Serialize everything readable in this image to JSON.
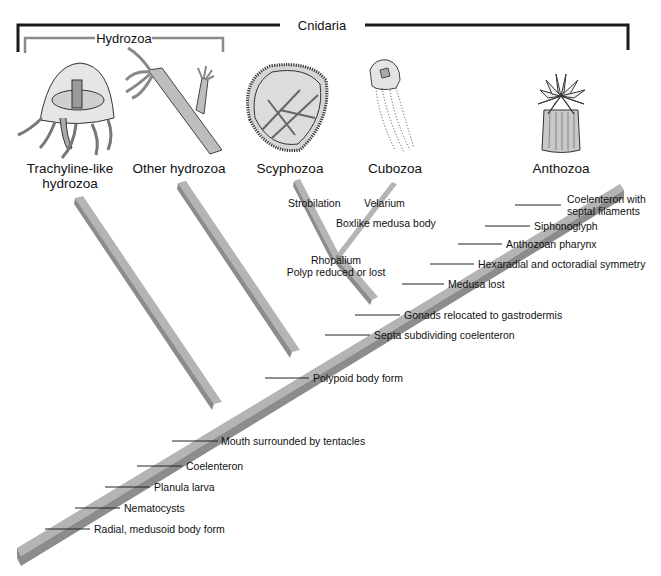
{
  "title_groups": {
    "cnidaria": "Cnidaria",
    "hydrozoa": "Hydrozoa"
  },
  "taxa": [
    {
      "id": "trachyline",
      "line1": "Trachyline-like",
      "line2": "hydrozoa"
    },
    {
      "id": "other-hydrozoa",
      "line1": "Other hydrozoa",
      "line2": ""
    },
    {
      "id": "scyphozoa",
      "line1": "Scyphozoa",
      "line2": ""
    },
    {
      "id": "cubozoa",
      "line1": "Cubozoa",
      "line2": ""
    },
    {
      "id": "anthozoa",
      "line1": "Anthozoa",
      "line2": ""
    }
  ],
  "traits": {
    "main_stem": [
      "Radial, medusoid body form",
      "Nematocysts",
      "Planula larva",
      "Coelenteron",
      "Mouth surrounded by tentacles",
      "Polypoid body form",
      "Septa subdividing coelenteron",
      "Gonads relocated to gastrodermis",
      "Medusa lost",
      "Hexaradial and octoradial symmetry",
      "Anthozoan pharynx",
      "Siphonoglyph",
      "Coelenteron with",
      "septal filaments"
    ],
    "scypho_cubo": {
      "rhopalium": "Rhopalium",
      "polyp_reduced": "Polyp reduced or lost",
      "strobilation": "Strobilation",
      "velarium": "Velarium",
      "boxlike": "Boxlike medusa body"
    }
  },
  "colors": {
    "branch_top": "#b4b4b4",
    "branch_side": "#8c8c8c",
    "cnidaria_bracket": "#1a1a1a",
    "hydrozoa_bracket": "#8a8a8a"
  }
}
